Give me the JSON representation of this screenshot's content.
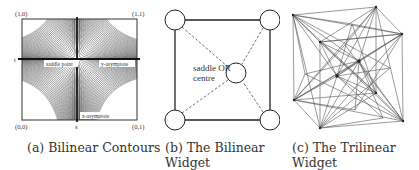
{
  "figure": {
    "panels": [
      {
        "id": "a",
        "caption": "(a) Bilinear Contours",
        "corner_labels": {
          "top_left": "(1,0)",
          "top_right": "(1,1)",
          "bottom_left": "(0,0)",
          "bottom_right": "(0,1)"
        },
        "axis_labels": {
          "t": "t",
          "s": "s"
        },
        "annotations": {
          "saddle_point": "saddle point",
          "y_asymptote": "y-asymptote",
          "x_asymptote": "x-asymptote"
        }
      },
      {
        "id": "b",
        "caption": "(b) The Bilinear\nWidget",
        "center_label_line1": "saddle OR",
        "center_label_line2": "centre"
      },
      {
        "id": "c",
        "caption": "(c) The Trilinear\nWidget"
      }
    ]
  },
  "colors": {
    "line": "#222222",
    "contour": "#555555",
    "dashed": "#444444",
    "mesh": "#555555"
  }
}
